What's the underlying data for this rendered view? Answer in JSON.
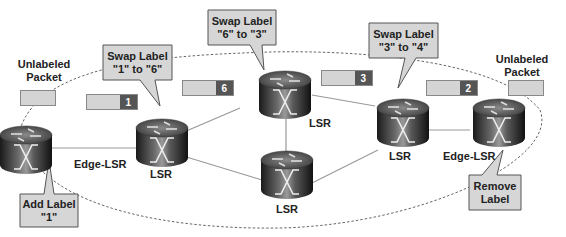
{
  "diagram": {
    "colors": {
      "callout_fill": "#d6d6d6",
      "callout_border": "#555555",
      "packet_body": "#d4d4d4",
      "label_tag": "#555555",
      "link": "#999999",
      "ellipse": "#555555"
    },
    "nodes": [
      {
        "id": "edge-left",
        "type": "router",
        "label": "Edge-LSR"
      },
      {
        "id": "lsr-1",
        "type": "router",
        "label": "LSR"
      },
      {
        "id": "lsr-top",
        "type": "router",
        "label": "LSR"
      },
      {
        "id": "lsr-bottom",
        "type": "router",
        "label": "LSR"
      },
      {
        "id": "lsr-right",
        "type": "router",
        "label": "LSR"
      },
      {
        "id": "edge-right",
        "type": "router",
        "label": "Edge-LSR"
      }
    ],
    "links": [
      [
        "edge-left",
        "lsr-1"
      ],
      [
        "lsr-1",
        "lsr-top"
      ],
      [
        "lsr-1",
        "lsr-bottom"
      ],
      [
        "lsr-top",
        "lsr-bottom"
      ],
      [
        "lsr-top",
        "lsr-right"
      ],
      [
        "lsr-bottom",
        "lsr-right"
      ],
      [
        "lsr-right",
        "edge-right"
      ]
    ],
    "text_labels": {
      "unlabeled_left": [
        "Unlabeled",
        "Packet"
      ],
      "unlabeled_right": [
        "Unlabeled",
        "Packet"
      ]
    },
    "callouts": [
      {
        "id": "add-label",
        "lines": [
          "Add Label",
          "\"1\""
        ]
      },
      {
        "id": "swap-1-6",
        "lines": [
          "Swap Label",
          "\"1\" to \"6\""
        ]
      },
      {
        "id": "swap-6-3",
        "lines": [
          "Swap Label",
          "\"6\" to \"3\""
        ]
      },
      {
        "id": "swap-3-4",
        "lines": [
          "Swap Label",
          "\"3\" to \"4\""
        ]
      },
      {
        "id": "remove-label",
        "lines": [
          "Remove",
          "Label"
        ]
      }
    ],
    "packets": [
      {
        "id": "pkt-unlabeled-left",
        "label": ""
      },
      {
        "id": "pkt-1",
        "label": "1"
      },
      {
        "id": "pkt-6",
        "label": "6"
      },
      {
        "id": "pkt-3",
        "label": "3"
      },
      {
        "id": "pkt-2",
        "label": "2"
      },
      {
        "id": "pkt-unlabeled-right",
        "label": ""
      }
    ]
  }
}
